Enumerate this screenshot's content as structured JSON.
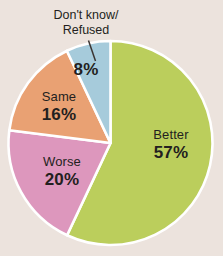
{
  "chart_data": {
    "type": "pie",
    "title": "",
    "subtitle": "",
    "xlabel": "",
    "ylabel": "",
    "legend_position": "none",
    "grid": false,
    "start_angle_deg": 0,
    "direction": "clockwise",
    "categories": [
      "Better",
      "Worse",
      "Same",
      "Don't know/Refused"
    ],
    "values": [
      57,
      20,
      16,
      8
    ],
    "value_labels": [
      "57%",
      "20%",
      "16%",
      "8%"
    ],
    "units": "percent",
    "total": 101,
    "slices": [
      {
        "label": "Better",
        "value": 57,
        "value_label": "57%",
        "color": "#bbce5c",
        "start_deg": 0,
        "end_deg": 205.2,
        "label_placement": "inside"
      },
      {
        "label": "Worse",
        "value": 20,
        "value_label": "20%",
        "color": "#dd97bd",
        "start_deg": 205.2,
        "end_deg": 277.2,
        "label_placement": "inside"
      },
      {
        "label": "Same",
        "value": 16,
        "value_label": "16%",
        "color": "#e9a173",
        "start_deg": 277.2,
        "end_deg": 334.8,
        "label_placement": "inside"
      },
      {
        "label": "Don't know/Refused",
        "value": 8,
        "value_label": "8%",
        "color": "#a6cbdb",
        "start_deg": 334.8,
        "end_deg": 360,
        "label_placement": "callout"
      }
    ],
    "annotations": [
      {
        "name": "dontknow-callout",
        "line_1": "Don't know/",
        "line_2": "Refused",
        "has_leader_line": true
      }
    ]
  },
  "style": {
    "background": "#ece3dd",
    "slice_separator": "#ffffff",
    "text_color": "#231f20",
    "leader_line_color": "#3c3532"
  }
}
